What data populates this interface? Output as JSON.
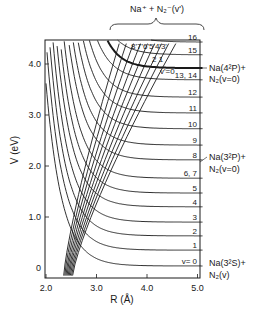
{
  "chart_data": {
    "type": "line",
    "title": "",
    "xlabel": "R (Å)",
    "ylabel": "V (eV)",
    "xlim": [
      2.0,
      5.1
    ],
    "ylim": [
      -0.2,
      4.6
    ],
    "x_ticks": [
      2.0,
      3.0,
      4.0,
      5.0
    ],
    "x_tick_labels": [
      "2.0",
      "3.0",
      "4.0",
      "5.0"
    ],
    "y_ticks": [
      0,
      1.0,
      2.0,
      3.0,
      4.0
    ],
    "y_tick_labels": [
      "0",
      "1.0",
      "2.0",
      "3.0",
      "4.0"
    ],
    "grid": false,
    "covalent_series": {
      "name": "Na + N2(v) / Na* + N2(v=0) covalent potentials",
      "levels": [
        {
          "label": "v= 0",
          "asymptote": 0.04
        },
        {
          "label": "1",
          "asymptote": 0.35
        },
        {
          "label": "2",
          "asymptote": 0.63
        },
        {
          "label": "3",
          "asymptote": 0.9
        },
        {
          "label": "4",
          "asymptote": 1.2
        },
        {
          "label": "5",
          "asymptote": 1.47
        },
        {
          "label": "6, 7",
          "asymptote": 1.76
        },
        {
          "label": "8",
          "asymptote": 2.12
        },
        {
          "label": "9",
          "asymptote": 2.41
        },
        {
          "label": "10",
          "asymptote": 2.73
        },
        {
          "label": "11",
          "asymptote": 3.04
        },
        {
          "label": "12",
          "asymptote": 3.35
        },
        {
          "label": "13, 14",
          "asymptote": 3.69
        },
        {
          "label": "v'=0",
          "asymptote": 3.92,
          "thick": true
        },
        {
          "label": "15",
          "asymptote": 4.18
        },
        {
          "label": "16",
          "asymptote": 4.43
        }
      ]
    },
    "ionic_series": {
      "name": "Na+ + N2-(v')",
      "labels": [
        "8",
        "7",
        "6",
        "5",
        "4",
        "3",
        "2",
        "1",
        "v'=0"
      ],
      "count": 9
    },
    "annotations": [
      {
        "text": "Na⁺ + N₂⁻(v')",
        "position": "top brace"
      },
      {
        "text": "Na(4²P)+",
        "subtext": "N₂(v=0)",
        "y": 3.92
      },
      {
        "text": "Na(3²P)+",
        "subtext": "N₂(v=0)",
        "y": 2.08
      },
      {
        "text": "Na(3²S)+",
        "subtext": "N₂(v)",
        "y": 0.04
      }
    ]
  },
  "labels": {
    "top_brace": "Na⁺ + N₂⁻(v')",
    "na4p_line1": "Na(4²P)+",
    "na4p_line2": "N₂(v=0)",
    "na3p_line1": "Na(3²P)+",
    "na3p_line2": "N₂(v=0)",
    "na3s_line1": "Na(3²S)+",
    "na3s_line2": "N₂(v)",
    "xlabel": "R (Å)",
    "ylabel": "V (eV)",
    "ionic_top_labels": "8'7'6'5'4'3'",
    "ionic_21": "2  1",
    "ionic_v0": "v'=0"
  }
}
